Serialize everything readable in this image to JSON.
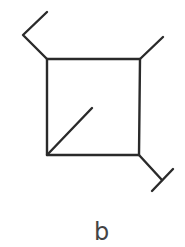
{
  "figure": {
    "caption": "b",
    "stroke_color": "#2a2a2a",
    "caption_color": "#444444",
    "square": {
      "top_left": [
        47,
        59
      ],
      "top_right": [
        140,
        59
      ],
      "bottom_right": [
        139,
        155
      ],
      "bottom_left": [
        47,
        155
      ]
    },
    "segments": [
      {
        "name": "top-left-arm-lower",
        "from": [
          47,
          59
        ],
        "to": [
          23,
          35
        ]
      },
      {
        "name": "top-left-arm-upper",
        "from": [
          23,
          35
        ],
        "to": [
          47,
          12
        ]
      },
      {
        "name": "top-right-arm",
        "from": [
          140,
          59
        ],
        "to": [
          163,
          37
        ]
      },
      {
        "name": "bottom-right-arm",
        "from": [
          139,
          155
        ],
        "to": [
          162,
          180
        ]
      },
      {
        "name": "bottom-right-crossbar",
        "from": [
          173,
          169
        ],
        "to": [
          152,
          191
        ]
      },
      {
        "name": "inner-diagonal",
        "from": [
          47,
          155
        ],
        "to": [
          92,
          108
        ]
      }
    ]
  }
}
